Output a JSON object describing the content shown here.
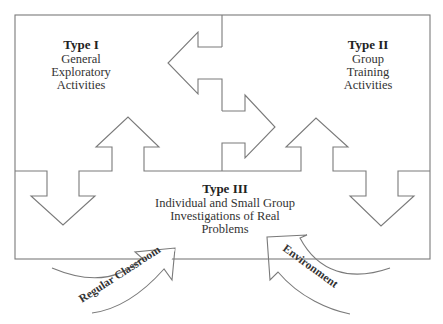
{
  "diagram": {
    "type_i": {
      "title": "Type I",
      "lines": [
        "General",
        "Exploratory",
        "Activities"
      ]
    },
    "type_ii": {
      "title": "Type II",
      "lines": [
        "Group",
        "Training",
        "Activities"
      ]
    },
    "type_iii": {
      "title": "Type III",
      "lines": [
        "Individual and Small Group",
        "Investigations of Real",
        "Problems"
      ]
    },
    "inputs": [
      {
        "label": "Regular Classroom"
      },
      {
        "label": "Environment"
      }
    ],
    "colors": {
      "stroke": "#7a7a7a",
      "text": "#333333",
      "background": "#ffffff"
    }
  }
}
